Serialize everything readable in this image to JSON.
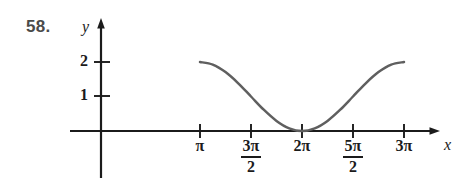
{
  "figure": {
    "problem_number": "58.",
    "background_color": "#ffffff",
    "axis_color": "#1b1b1b",
    "curve_color": "#5f5f5f"
  },
  "axes": {
    "y_label": "y",
    "x_label": "x",
    "y_ticks": [
      {
        "label": "2",
        "value": 2
      },
      {
        "label": "1",
        "value": 1
      }
    ],
    "x_ticks": [
      {
        "label": "π",
        "numerator": "",
        "denominator": "",
        "value": 3.1416
      },
      {
        "label": "",
        "numerator": "3π",
        "denominator": "2",
        "value": 4.7124
      },
      {
        "label": "2π",
        "numerator": "",
        "denominator": "",
        "value": 6.2832
      },
      {
        "label": "",
        "numerator": "5π",
        "denominator": "2",
        "value": 7.854
      },
      {
        "label": "3π",
        "numerator": "",
        "denominator": "",
        "value": 9.4248
      }
    ]
  },
  "chart_data": {
    "type": "line",
    "title": "",
    "xlabel": "x",
    "ylabel": "y",
    "xlim": [
      3.1416,
      9.4248
    ],
    "ylim": [
      0,
      2
    ],
    "grid": false,
    "legend": "none",
    "x_tick_labels": [
      "π",
      "3π/2",
      "2π",
      "5π/2",
      "3π"
    ],
    "x_tick_values": [
      3.1416,
      4.7124,
      6.2832,
      7.854,
      9.4248
    ],
    "y_tick_labels": [
      "1",
      "2"
    ],
    "y_tick_values": [
      1,
      2
    ],
    "series": [
      {
        "name": "y = 1 + cos x",
        "x": [
          3.1416,
          3.5343,
          3.927,
          4.3197,
          4.7124,
          5.1051,
          5.4978,
          5.8905,
          6.2832,
          6.6759,
          7.0686,
          7.4613,
          7.854,
          8.2467,
          8.6394,
          9.0321,
          9.4248
        ],
        "y": [
          2.0,
          1.924,
          1.707,
          1.383,
          1.0,
          0.617,
          0.293,
          0.076,
          0.0,
          0.076,
          0.293,
          0.617,
          1.0,
          1.383,
          1.707,
          1.924,
          2.0
        ]
      }
    ],
    "annotations": [
      {
        "text": "minimum at (2π, 0)",
        "x": 6.2832,
        "y": 0
      },
      {
        "text": "endpoint at (π, 2)",
        "x": 3.1416,
        "y": 2
      },
      {
        "text": "endpoint at (3π, 2)",
        "x": 9.4248,
        "y": 2
      }
    ]
  }
}
